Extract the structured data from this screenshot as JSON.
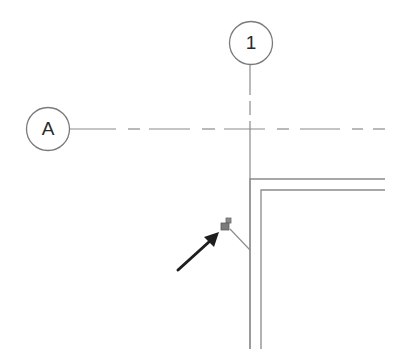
{
  "grid": {
    "vertical": {
      "label": "1",
      "bubble_center": [
        251,
        43
      ],
      "x": 250
    },
    "horizontal": {
      "label": "A",
      "bubble_center": [
        48,
        129
      ],
      "y": 129
    }
  },
  "wall": {
    "outer_corner": [
      250,
      179
    ],
    "inner_corner": [
      261,
      190
    ],
    "end_x": 385,
    "end_y": 349
  },
  "annotation": {
    "icon": "padlock-icon",
    "arrow": "arrow-icon"
  },
  "colors": {
    "line": "#8a8a8a",
    "bubble": "#7a7a7a",
    "text": "#2a2a2a",
    "lock": "#7b7b7b",
    "arrow": "#1e1e1e"
  }
}
